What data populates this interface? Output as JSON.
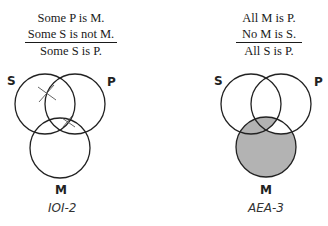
{
  "left": {
    "premise_1": "Some P is M.",
    "premise_2": "Some S is not M.",
    "conclusion": "Some S is P.",
    "labels": {
      "s": "S",
      "p": "P",
      "m": "M"
    },
    "caption": "IOI-2",
    "marks": [
      "x-mark",
      "x-mark"
    ]
  },
  "right": {
    "premise_1": "All M is P.",
    "premise_2": "No M is S.",
    "conclusion": "All S is P.",
    "labels": {
      "s": "S",
      "p": "P",
      "m": "M"
    },
    "caption": "AEA-3",
    "shade_color": "#b3b3b3"
  }
}
